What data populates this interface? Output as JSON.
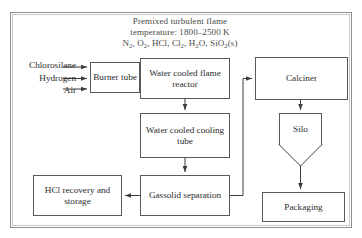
{
  "diagram": {
    "header": {
      "line1": "Premixed turbulent flame",
      "line2": "temperature: 1800–2500 K",
      "species_prefix": "N",
      "line3_parts": [
        {
          "text": "N",
          "sub": "2"
        },
        {
          "text": ", O",
          "sub": "2"
        },
        {
          "text": ", HCl, Cl",
          "sub": "2"
        },
        {
          "text": ", H",
          "sub": "2"
        },
        {
          "text": "O, SiO",
          "sub": "2"
        },
        {
          "text": "(s)",
          "sub": ""
        }
      ],
      "line3_plain": "N2, O2, HCl, Cl2, H2O, SiO2(s)"
    },
    "inputs": [
      {
        "label": "Chlorosilane"
      },
      {
        "label": "Hydrogen"
      },
      {
        "label": "Air"
      }
    ],
    "nodes": {
      "burner": "Burner tube",
      "reactor": "Water cooled flame reactor",
      "cooling": "Water cooled cooling tube",
      "gassolid": "Gassolid separation",
      "hcl": "HCl recovery and storage",
      "calciner": "Calciner",
      "silo": "Silo",
      "packaging": "Packaging"
    },
    "colors": {
      "frame_outer": "#8e8e8e",
      "frame_inner": "#c9c9c9",
      "node_border": "#5a5a5a",
      "connector": "#3d3d3d",
      "header_text": "#4a4a4a",
      "node_text": "#2b2b2b",
      "background": "#ffffff"
    }
  }
}
